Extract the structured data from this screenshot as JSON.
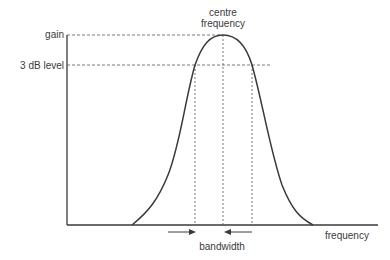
{
  "diagram": {
    "labels": {
      "y_top": "gain",
      "y_3db": "3 dB level",
      "centre_line1": "centre",
      "centre_line2": "frequency",
      "x_axis": "frequency",
      "bandwidth": "bandwidth"
    },
    "colors": {
      "line": "#3a3a3a",
      "dashed": "#555555",
      "background": "#ffffff"
    },
    "geometry": {
      "origin": [
        67,
        225
      ],
      "y_axis_top": 35,
      "x_axis_end": 378,
      "gain_level_y": 35,
      "three_db_level_y": 65,
      "three_db_line_end_x": 272,
      "curve_start_x": 132,
      "curve_peak": [
        223,
        35
      ],
      "curve_end_x": 313,
      "left_3db_x": 195,
      "right_3db_x": 252,
      "bandwidth_arrow_y": 232
    }
  }
}
